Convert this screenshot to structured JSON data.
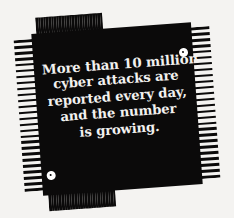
{
  "graphic": {
    "type": "microchip-infographic",
    "background_color": "#f4f3f1",
    "chip_body_color": "#0b0a0a",
    "text_color": "#f2f1ef",
    "rotation_degrees": -4.2,
    "pins_per_side": 26
  },
  "message": {
    "full_text": "More than 10 million cyber attacks are reported every day, and the number is growing.",
    "lines": [
      "More than 10 million",
      "cyber attacks are",
      "reported every day,",
      "and the number",
      "is growing."
    ]
  },
  "markers": {
    "top_right_label": "pin-one-marker",
    "bottom_left_label": "pin-one-marker"
  }
}
